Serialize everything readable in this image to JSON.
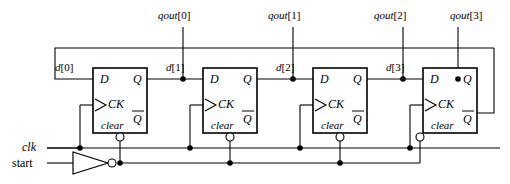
{
  "diagram": {
    "line_color": "#000000",
    "background": "#ffffff"
  },
  "outputs": [
    {
      "label_prefix": "qout",
      "index": "[0]",
      "text": "qout[0]"
    },
    {
      "label_prefix": "qout",
      "index": "[1]",
      "text": "qout[1]"
    },
    {
      "label_prefix": "qout",
      "index": "[2]",
      "text": "qout[2]"
    },
    {
      "label_prefix": "qout",
      "index": "[3]",
      "text": "qout[3]"
    }
  ],
  "datalines": [
    {
      "label_prefix": "d",
      "index": "[0]",
      "text": "d[0]"
    },
    {
      "label_prefix": "d",
      "index": "[1]",
      "text": "d[1]"
    },
    {
      "label_prefix": "d",
      "index": "[2]",
      "text": "d[2]"
    },
    {
      "label_prefix": "d",
      "index": "[3]",
      "text": "d[3]"
    }
  ],
  "inputs": {
    "clk": "clk",
    "start": "start"
  },
  "flipflops": [
    {
      "id": "ff0",
      "d": "D",
      "q": "Q",
      "ck": "CK",
      "qbar": "Q",
      "clear": "clear"
    },
    {
      "id": "ff1",
      "d": "D",
      "q": "Q",
      "ck": "CK",
      "qbar": "Q",
      "clear": "clear"
    },
    {
      "id": "ff2",
      "d": "D",
      "q": "Q",
      "ck": "CK",
      "qbar": "Q",
      "clear": "clear"
    },
    {
      "id": "ff3",
      "d": "D",
      "q": "Q",
      "ck": "CK",
      "qbar": "Q",
      "clear": "clear"
    }
  ]
}
